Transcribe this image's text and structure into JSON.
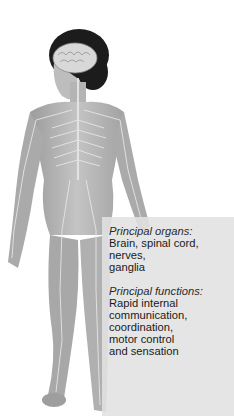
{
  "illustration": {
    "subject": "female human figure showing nervous system",
    "colors": {
      "skin": "#b8b8b8",
      "nerves": "#e6e6e6",
      "hair": "#1c1c1c",
      "brain": "#d8d8d8",
      "panel": "#e1e1e1"
    }
  },
  "panel": {
    "organs_label": "Principal organs:",
    "organs_text_line1": "Brain, spinal cord, nerves,",
    "organs_text_line2": "ganglia",
    "functions_label": "Principal functions:",
    "functions_lines": [
      "Rapid internal",
      "communication,",
      "coordination,",
      "motor control",
      "and sensation"
    ]
  }
}
